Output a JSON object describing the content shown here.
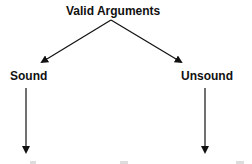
{
  "diagram": {
    "title": "Valid Arguments",
    "nodes": [
      {
        "id": "root",
        "label": "Valid Arguments"
      },
      {
        "id": "sound",
        "label": "Sound"
      },
      {
        "id": "unsound",
        "label": "Unsound"
      }
    ],
    "edges": [
      {
        "from": "root",
        "to": "sound"
      },
      {
        "from": "root",
        "to": "unsound"
      },
      {
        "from": "sound",
        "to": "below-sound"
      },
      {
        "from": "unsound",
        "to": "below-unsound"
      }
    ],
    "colors": {
      "line": "#111111",
      "background": "#ffffff"
    }
  }
}
